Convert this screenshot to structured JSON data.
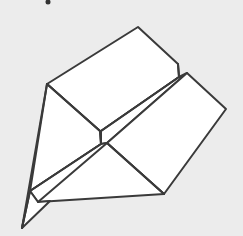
{
  "image": {
    "subject": "paper airplane line drawing",
    "background_color": "#ececec",
    "paper_color": "#ffffff",
    "stroke_color": "#3a3a3a",
    "stroke_width": 2
  },
  "shapes": {
    "top_left_wing": "47,84 138,27 178,64 179,77 101,131 100,131",
    "left_face": "47,84 100,131 101,144 30,191",
    "fold_strip": "101,131 179,77 179,77 187,73 107,143 101,144",
    "right_wing": "187,73 226,109 164,194 107,143",
    "bottom_face": "107,143 164,194 38,202 30,191 101,144",
    "tail": "30,191 38,202 50,201 22,228"
  },
  "mark": {
    "x": 48,
    "y": 2
  }
}
